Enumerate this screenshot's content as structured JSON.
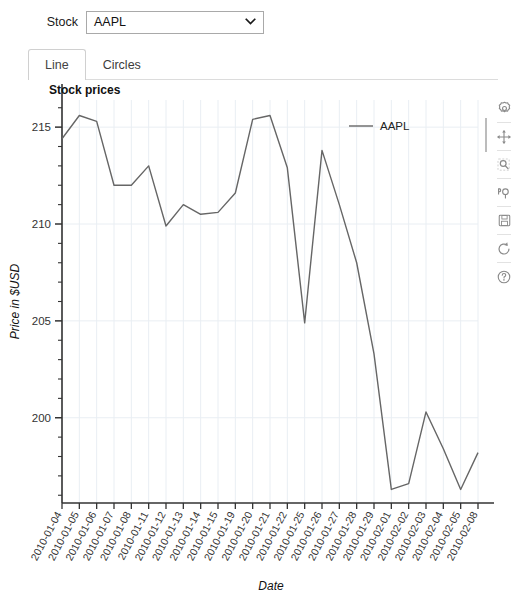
{
  "controls": {
    "stock_label": "Stock",
    "stock_selected": "AAPL",
    "stock_options": [
      "AAPL"
    ],
    "chevron_icon": "chevron-down-icon"
  },
  "tabs": [
    {
      "label": "Line",
      "active": true
    },
    {
      "label": "Circles",
      "active": false
    }
  ],
  "toolbar": {
    "buttons": [
      {
        "icon": "settings-gear-icon",
        "name": "configure-subplots-button"
      },
      {
        "icon": "move-arrows-icon",
        "name": "pan-button"
      },
      {
        "icon": "zoom-magnifier-icon",
        "name": "zoom-button"
      },
      {
        "icon": "pan-axes-icon",
        "name": "pan-axes-button"
      },
      {
        "icon": "save-disk-icon",
        "name": "save-button"
      },
      {
        "icon": "reset-refresh-icon",
        "name": "reset-button"
      },
      {
        "icon": "help-question-icon",
        "name": "help-button"
      }
    ]
  },
  "chart_data": {
    "type": "line",
    "title": "Stock prices",
    "xlabel": "Date",
    "ylabel": "Price in $USD",
    "grid": true,
    "legend_position": "top-right",
    "ylim": [
      195.6,
      216.4
    ],
    "yticks": [
      200,
      205,
      210,
      215
    ],
    "ytick_labels": [
      "200",
      "205",
      "210",
      "215"
    ],
    "yminor_step": 1,
    "line_color": "#666666",
    "categories": [
      "2010-01-04",
      "2010-01-05",
      "2010-01-06",
      "2010-01-07",
      "2010-01-08",
      "2010-01-11",
      "2010-01-12",
      "2010-01-13",
      "2010-01-14",
      "2010-01-15",
      "2010-01-19",
      "2010-01-20",
      "2010-01-21",
      "2010-01-22",
      "2010-01-25",
      "2010-01-26",
      "2010-01-27",
      "2010-01-28",
      "2010-01-29",
      "2010-02-01",
      "2010-02-02",
      "2010-02-03",
      "2010-02-04",
      "2010-02-05",
      "2010-02-08"
    ],
    "series": [
      {
        "name": "AAPL",
        "values": [
          214.4,
          215.6,
          215.3,
          212.0,
          212.0,
          213.0,
          209.9,
          211.0,
          210.5,
          210.6,
          211.6,
          215.4,
          215.6,
          212.9,
          204.9,
          213.8,
          211.0,
          208.0,
          203.3,
          196.3,
          196.6,
          200.3,
          198.4,
          196.3,
          198.2
        ]
      }
    ]
  }
}
